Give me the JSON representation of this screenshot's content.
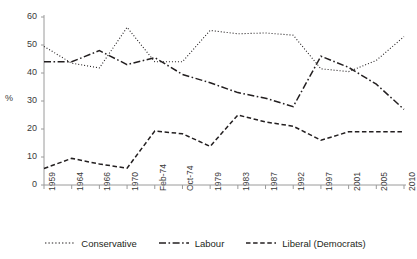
{
  "chart_data": {
    "type": "line",
    "title": "",
    "subtitle": "",
    "xlabel": "",
    "ylabel": "%",
    "ylim": [
      0,
      60
    ],
    "yticks": [
      0,
      10,
      20,
      30,
      40,
      50,
      60
    ],
    "grid": false,
    "legend_position": "bottom",
    "categories": [
      "1959",
      "1964",
      "1966",
      "1970",
      "Feb-74",
      "Oct-74",
      "1979",
      "1983",
      "1987",
      "1992",
      "1997",
      "2001",
      "2005",
      "2010"
    ],
    "series": [
      {
        "name": "Conservative",
        "style": "dotted",
        "values": [
          49.5,
          43.5,
          41.8,
          56.3,
          44.0,
          44.0,
          55.2,
          54.0,
          54.3,
          53.5,
          41.5,
          40.5,
          44.5,
          53.0
        ]
      },
      {
        "name": "Labour",
        "style": "dash-dot",
        "values": [
          44.0,
          44.0,
          48.0,
          43.0,
          45.5,
          39.5,
          36.5,
          33.0,
          31.0,
          28.0,
          46.0,
          42.0,
          36.0,
          27.0
        ]
      },
      {
        "name": "Liberal (Democrats)",
        "style": "dashed",
        "values": [
          5.9,
          9.5,
          7.5,
          6.0,
          19.3,
          18.3,
          13.8,
          25.0,
          22.5,
          21.0,
          16.0,
          19.0,
          19.0,
          19.0
        ]
      }
    ],
    "colors": {
      "line": "#231f20",
      "axis": "#9a9a9a",
      "text": "#3a3a3a",
      "background": "#ffffff"
    }
  },
  "legend": {
    "items": [
      {
        "label": "Conservative"
      },
      {
        "label": "Labour"
      },
      {
        "label": "Liberal (Democrats)"
      }
    ]
  }
}
